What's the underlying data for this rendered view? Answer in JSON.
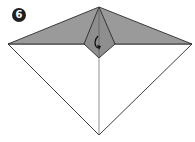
{
  "step": {
    "number": "6"
  },
  "diagram": {
    "colors": {
      "colored_side": "#9a9a9a",
      "white_side": "#ffffff",
      "lines": "#2a2a2a",
      "badge": "#1f1f1f"
    },
    "icons": [
      "fold-arrow-icon"
    ]
  }
}
